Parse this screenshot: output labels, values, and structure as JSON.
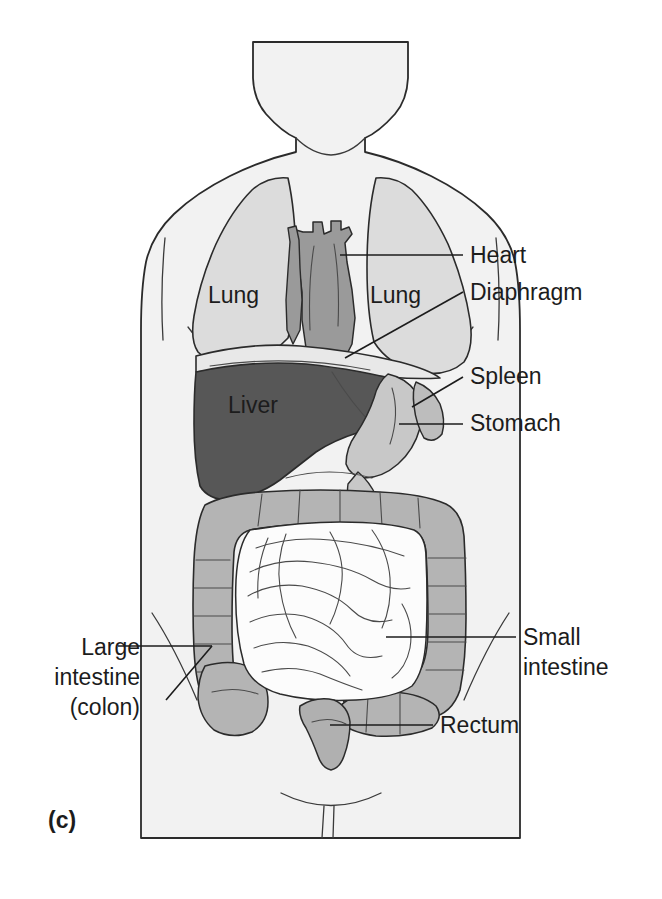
{
  "figure": {
    "caption_label": "(c)",
    "view": "anterior",
    "background_color": "#ffffff"
  },
  "colors": {
    "body_fill": "#f2f2f2",
    "body_outline": "#2b2b2b",
    "lung_fill": "#dcdcdc",
    "heart_fill": "#9a9a9a",
    "liver_fill": "#575757",
    "stomach_fill": "#c8c8c8",
    "spleen_fill": "#bdbdbd",
    "large_intestine_fill": "#b4b4b4",
    "small_intestine_fill": "#fcfcfc",
    "rectum_fill": "#b0b0b0",
    "label_text": "#1c1c1c",
    "leader_line": "#1c1c1c"
  },
  "organ_labels": [
    {
      "id": "lung-left",
      "text": "Lung",
      "x": 208,
      "y": 303,
      "anchor": "start",
      "placement": "on-organ"
    },
    {
      "id": "lung-right",
      "text": "Lung",
      "x": 370,
      "y": 303,
      "anchor": "start",
      "placement": "on-organ"
    },
    {
      "id": "liver",
      "text": "Liver",
      "x": 228,
      "y": 413,
      "anchor": "start",
      "placement": "on-organ"
    }
  ],
  "callouts": [
    {
      "id": "heart",
      "lines": [
        "Heart"
      ],
      "x": 470,
      "y": 263,
      "anchor": "start",
      "leader": "M 340 255 L 463 255"
    },
    {
      "id": "diaphragm",
      "lines": [
        "Diaphragm"
      ],
      "x": 470,
      "y": 300,
      "anchor": "start",
      "leader": "M 345 358 L 463 292"
    },
    {
      "id": "spleen",
      "lines": [
        "Spleen"
      ],
      "x": 470,
      "y": 384,
      "anchor": "start",
      "leader": "M 412 407 L 463 377"
    },
    {
      "id": "stomach",
      "lines": [
        "Stomach"
      ],
      "x": 470,
      "y": 431,
      "anchor": "start",
      "leader": "M 399 424 L 463 424"
    },
    {
      "id": "small-intestine",
      "lines": [
        "Small",
        "intestine"
      ],
      "x": 523,
      "y": 645,
      "anchor": "start",
      "leader": "M 386 637 L 516 637"
    },
    {
      "id": "rectum",
      "lines": [
        "Rectum"
      ],
      "x": 440,
      "y": 733,
      "anchor": "start",
      "leader": "M 330 725 L 433 725"
    },
    {
      "id": "large-intestine",
      "lines": [
        "Large",
        "intestine",
        "(colon)"
      ],
      "x": 140,
      "y": 655,
      "anchor": "end",
      "leader": "M 212 646 L 118 646"
    }
  ],
  "caption": {
    "text": "(c)",
    "x": 48,
    "y": 828
  }
}
